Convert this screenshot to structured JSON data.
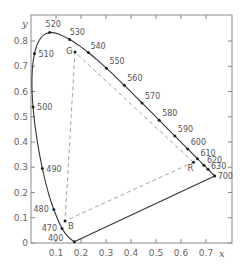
{
  "diagram": {
    "axes": {
      "x_label": "x",
      "y_label": "y",
      "x_ticks": [
        "0.1",
        "0.2",
        "0.3",
        "0.4",
        "0.5",
        "0.6",
        "0.7"
      ],
      "x_tick_values": [
        0.1,
        0.2,
        0.3,
        0.4,
        0.5,
        0.6,
        0.7
      ],
      "y_ticks": [
        "0",
        "0.1",
        "0.2",
        "0.3",
        "0.4",
        "0.5",
        "0.6",
        "0.7",
        "0.8"
      ],
      "y_tick_values": [
        0,
        0.1,
        0.2,
        0.3,
        0.4,
        0.5,
        0.6,
        0.7,
        0.8
      ],
      "x_range": [
        0,
        0.8
      ],
      "y_range": [
        0,
        0.8
      ]
    },
    "spectral_locus_labels": [
      {
        "nm": "400",
        "x": 0.1733,
        "y": 0.0048
      },
      {
        "nm": "470",
        "x": 0.1241,
        "y": 0.0578
      },
      {
        "nm": "480",
        "x": 0.0913,
        "y": 0.1327
      },
      {
        "nm": "490",
        "x": 0.0454,
        "y": 0.295
      },
      {
        "nm": "500",
        "x": 0.0082,
        "y": 0.5384
      },
      {
        "nm": "510",
        "x": 0.0139,
        "y": 0.7502
      },
      {
        "nm": "520",
        "x": 0.0743,
        "y": 0.8338
      },
      {
        "nm": "530",
        "x": 0.1547,
        "y": 0.8059
      },
      {
        "nm": "540",
        "x": 0.2296,
        "y": 0.7543
      },
      {
        "nm": "550",
        "x": 0.3016,
        "y": 0.6923
      },
      {
        "nm": "560",
        "x": 0.3731,
        "y": 0.6245
      },
      {
        "nm": "570",
        "x": 0.4441,
        "y": 0.5547
      },
      {
        "nm": "580",
        "x": 0.5125,
        "y": 0.4866
      },
      {
        "nm": "590",
        "x": 0.5752,
        "y": 0.4242
      },
      {
        "nm": "600",
        "x": 0.627,
        "y": 0.3725
      },
      {
        "nm": "610",
        "x": 0.6658,
        "y": 0.334
      },
      {
        "nm": "620",
        "x": 0.6915,
        "y": 0.3083
      },
      {
        "nm": "630",
        "x": 0.7079,
        "y": 0.292
      },
      {
        "nm": "700",
        "x": 0.7347,
        "y": 0.2653
      }
    ],
    "primaries": [
      {
        "label": "R",
        "x": 0.65,
        "y": 0.32
      },
      {
        "label": "G",
        "x": 0.176,
        "y": 0.756
      },
      {
        "label": "B",
        "x": 0.136,
        "y": 0.087
      }
    ],
    "colors": {
      "locus": "#333333",
      "triangle": "#999999",
      "frame": "#888888",
      "text": "#555555"
    }
  }
}
